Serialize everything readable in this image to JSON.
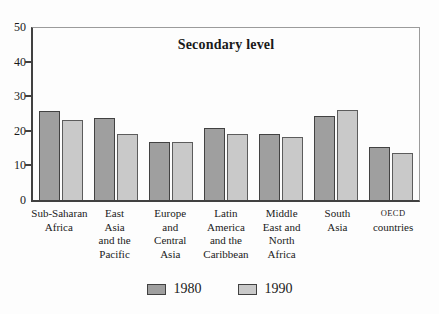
{
  "chart_data": {
    "type": "bar",
    "title": "Secondary level",
    "categories": [
      {
        "lines": [
          "Sub-Saharan",
          "Africa"
        ]
      },
      {
        "lines": [
          "East",
          "Asia",
          "and the",
          "Pacific"
        ]
      },
      {
        "lines": [
          "Europe",
          "and",
          "Central",
          "Asia"
        ]
      },
      {
        "lines": [
          "Latin",
          "America",
          "and the",
          "Caribbean"
        ]
      },
      {
        "lines": [
          "Middle",
          "East and",
          "North",
          "Africa"
        ]
      },
      {
        "lines": [
          "South",
          "Asia"
        ]
      },
      {
        "lines": [
          {
            "text": "OECD",
            "small_caps": true
          },
          "countries"
        ]
      }
    ],
    "series": [
      {
        "name": "1980",
        "color": "#9f9f9f",
        "border": "#424242",
        "values": [
          25.5,
          23.5,
          16.5,
          20.5,
          19,
          24,
          15
        ]
      },
      {
        "name": "1990",
        "color": "#c9c9c9",
        "border": "#5c5c5c",
        "values": [
          23,
          19,
          16.5,
          19,
          18,
          26,
          13.5
        ]
      }
    ],
    "ylim": [
      0,
      50
    ],
    "yticks": [
      0,
      10,
      20,
      30,
      40,
      50
    ],
    "xlabel": "",
    "ylabel": "",
    "grid": false,
    "legend_position": "bottom-center",
    "colors": {
      "axis_dark": "#414141",
      "frame_light": "#9b9b9b",
      "text": "#1a1a1a",
      "background": "#fdfdfd"
    }
  }
}
